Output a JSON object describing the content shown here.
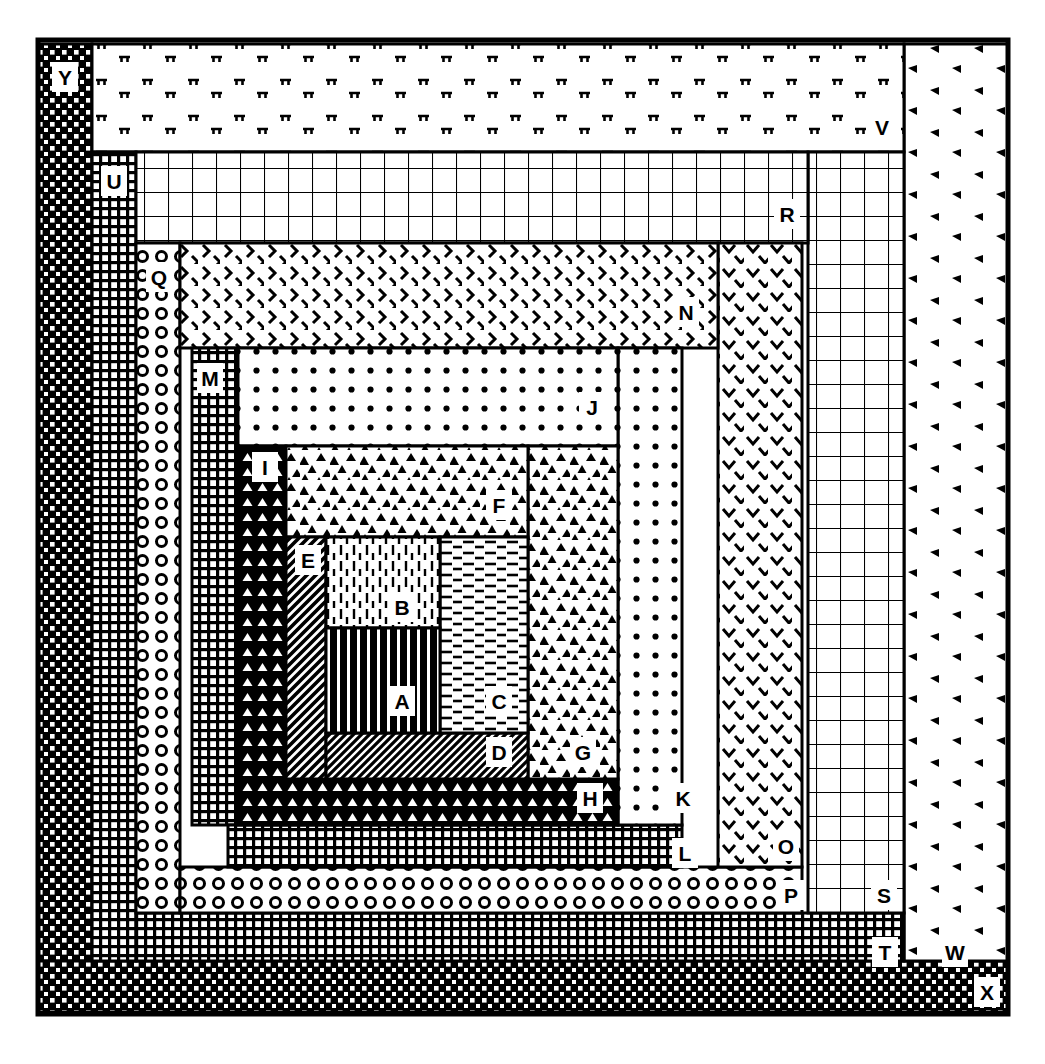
{
  "figure": {
    "background": "#ffffff",
    "ink": "#000000",
    "canvas": {
      "width": 1045,
      "height": 1064
    }
  },
  "chart_data": {
    "type": "table",
    "subtitle": "Concentric rectangular bands A (innermost) through Y (outermost), each rendered in a distinct black-and-white fill pattern",
    "xlabel": "",
    "ylabel": "",
    "legend_position": "in-place labels",
    "grid": false,
    "columns": [
      "label",
      "pattern",
      "x",
      "y",
      "width",
      "height"
    ],
    "rows": [
      {
        "label": "A",
        "pattern": "vertical-thick-bars",
        "x": 326,
        "y": 628,
        "width": 114,
        "height": 105
      },
      {
        "label": "B",
        "pattern": "vertical-dashed-lines",
        "x": 326,
        "y": 537,
        "width": 114,
        "height": 91
      },
      {
        "label": "C",
        "pattern": "horizontal-dashes",
        "x": 440,
        "y": 537,
        "width": 88,
        "height": 196
      },
      {
        "label": "D",
        "pattern": "diagonal-hatch-45",
        "x": 326,
        "y": 733,
        "width": 202,
        "height": 46
      },
      {
        "label": "E",
        "pattern": "diagonal-hatch-steep",
        "x": 286,
        "y": 537,
        "width": 40,
        "height": 242
      },
      {
        "label": "F",
        "pattern": "triangle-stipple",
        "x": 286,
        "y": 446,
        "width": 242,
        "height": 91
      },
      {
        "label": "G",
        "pattern": "triangle-stipple",
        "x": 528,
        "y": 446,
        "width": 90,
        "height": 333
      },
      {
        "label": "H",
        "pattern": "triangle-grid-dark",
        "x": 238,
        "y": 779,
        "width": 380,
        "height": 46
      },
      {
        "label": "I",
        "pattern": "triangle-grid-dark",
        "x": 238,
        "y": 446,
        "width": 48,
        "height": 333
      },
      {
        "label": "J",
        "pattern": "dot-grid",
        "x": 238,
        "y": 348,
        "width": 380,
        "height": 98
      },
      {
        "label": "K",
        "pattern": "dot-grid",
        "x": 618,
        "y": 348,
        "width": 64,
        "height": 477
      },
      {
        "label": "L",
        "pattern": "checker-grid-fine",
        "x": 228,
        "y": 825,
        "width": 454,
        "height": 42
      },
      {
        "label": "M",
        "pattern": "checker-grid-fine",
        "x": 192,
        "y": 348,
        "width": 46,
        "height": 477
      },
      {
        "label": "N",
        "pattern": "chevron-right",
        "x": 180,
        "y": 243,
        "width": 538,
        "height": 105
      },
      {
        "label": "O",
        "pattern": "chevron-down",
        "x": 718,
        "y": 243,
        "width": 84,
        "height": 624
      },
      {
        "label": "P",
        "pattern": "ring-circles",
        "x": 180,
        "y": 867,
        "width": 622,
        "height": 46
      },
      {
        "label": "Q",
        "pattern": "ring-circles",
        "x": 136,
        "y": 243,
        "width": 44,
        "height": 670
      },
      {
        "label": "R",
        "pattern": "square-grid-medium",
        "x": 136,
        "y": 152,
        "width": 672,
        "height": 91
      },
      {
        "label": "S",
        "pattern": "square-grid-medium",
        "x": 808,
        "y": 152,
        "width": 96,
        "height": 761
      },
      {
        "label": "T",
        "pattern": "checker-grid-fine",
        "x": 136,
        "y": 913,
        "width": 768,
        "height": 48
      },
      {
        "label": "U",
        "pattern": "checker-grid-fine",
        "x": 92,
        "y": 152,
        "width": 44,
        "height": 809
      },
      {
        "label": "V",
        "pattern": "tee-stipple",
        "x": 92,
        "y": 44,
        "width": 812,
        "height": 108
      },
      {
        "label": "W",
        "pattern": "arrow-stipple",
        "x": 904,
        "y": 44,
        "width": 104,
        "height": 917
      },
      {
        "label": "X",
        "pattern": "checker-dark",
        "x": 38,
        "y": 961,
        "width": 970,
        "height": 51
      },
      {
        "label": "Y",
        "pattern": "checker-dark",
        "x": 38,
        "y": 44,
        "width": 54,
        "height": 917
      }
    ]
  },
  "labels": {
    "A": "A",
    "B": "B",
    "C": "C",
    "D": "D",
    "E": "E",
    "F": "F",
    "G": "G",
    "H": "H",
    "I": "I",
    "J": "J",
    "K": "K",
    "L": "L",
    "M": "M",
    "N": "N",
    "O": "O",
    "P": "P",
    "Q": "Q",
    "R": "R",
    "S": "S",
    "T": "T",
    "U": "U",
    "V": "V",
    "W": "W",
    "X": "X",
    "Y": "Y"
  },
  "label_positions": {
    "A": {
      "x": 389,
      "y": 686
    },
    "B": {
      "x": 389,
      "y": 592
    },
    "C": {
      "x": 486,
      "y": 686
    },
    "D": {
      "x": 486,
      "y": 737
    },
    "E": {
      "x": 295,
      "y": 545
    },
    "F": {
      "x": 486,
      "y": 490
    },
    "G": {
      "x": 570,
      "y": 737
    },
    "H": {
      "x": 577,
      "y": 783
    },
    "I": {
      "x": 252,
      "y": 452
    },
    "J": {
      "x": 579,
      "y": 392
    },
    "K": {
      "x": 670,
      "y": 783
    },
    "L": {
      "x": 672,
      "y": 838
    },
    "M": {
      "x": 197,
      "y": 363
    },
    "N": {
      "x": 673,
      "y": 297
    },
    "O": {
      "x": 773,
      "y": 831
    },
    "P": {
      "x": 778,
      "y": 880
    },
    "Q": {
      "x": 146,
      "y": 262
    },
    "R": {
      "x": 774,
      "y": 199
    },
    "S": {
      "x": 871,
      "y": 880
    },
    "T": {
      "x": 872,
      "y": 937
    },
    "U": {
      "x": 101,
      "y": 166
    },
    "V": {
      "x": 869,
      "y": 112
    },
    "W": {
      "x": 942,
      "y": 937
    },
    "X": {
      "x": 974,
      "y": 977
    },
    "Y": {
      "x": 52,
      "y": 62
    }
  }
}
